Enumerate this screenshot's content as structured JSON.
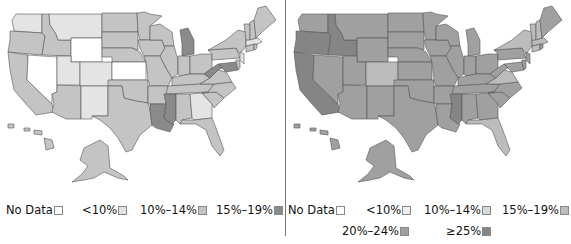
{
  "maps": [
    {
      "id": "left",
      "legend": [
        {
          "label": "No Data",
          "color": "#ffffff"
        },
        {
          "label": "<10%",
          "color": "#e4e4e4"
        },
        {
          "label": "10%–14%",
          "color": "#c4c4c4"
        },
        {
          "label": "15%–19%",
          "color": "#8a8a8a"
        }
      ]
    },
    {
      "id": "right",
      "legend": [
        {
          "label": "No Data",
          "color": "#ffffff"
        },
        {
          "label": "<10%",
          "color": "#eeeeee"
        },
        {
          "label": "10%–14%",
          "color": "#d8d8d8"
        },
        {
          "label": "15%–19%",
          "color": "#bcbcbc"
        },
        {
          "label": "20%–24%",
          "color": "#a0a0a0"
        },
        {
          "label": "≥25%",
          "color": "#858585"
        }
      ]
    }
  ],
  "chart_data": [
    {
      "type": "choropleth",
      "region": "United States",
      "legend": [
        "No Data",
        "<10%",
        "10%–14%",
        "15%–19%"
      ],
      "states": {
        "No Data": [
          "NV",
          "WY",
          "KS"
        ],
        "<10%": [
          "WA",
          "MT",
          "UT",
          "CO",
          "NM",
          "GA",
          "MA",
          "NJ"
        ],
        "10%–14%": [
          "OR",
          "ID",
          "CA",
          "AZ",
          "ND",
          "SD",
          "NE",
          "OK",
          "TX",
          "MN",
          "IA",
          "MO",
          "AR",
          "WI",
          "IL",
          "IN",
          "OH",
          "KY",
          "TN",
          "AL",
          "FL",
          "SC",
          "NC",
          "VA",
          "PA",
          "NY",
          "VT",
          "NH",
          "ME",
          "CT",
          "RI",
          "DE",
          "AK",
          "HI"
        ],
        "15%–19%": [
          "MI",
          "WV",
          "MS",
          "LA",
          "MD"
        ]
      }
    },
    {
      "type": "choropleth",
      "region": "United States",
      "legend": [
        "No Data",
        "<10%",
        "10%–14%",
        "15%–19%",
        "20%–24%",
        "≥25%"
      ],
      "states": {
        "15%–19%": [
          "CO",
          "NY",
          "VA",
          "FL",
          "VT",
          "NH",
          "MA",
          "CT"
        ],
        "20%–24%": [
          "WA",
          "MT",
          "WY",
          "NV",
          "UT",
          "AZ",
          "NM",
          "ND",
          "MN",
          "ME",
          "HI",
          "AK",
          "WI",
          "MI",
          "IL",
          "IN",
          "OH",
          "PA",
          "NJ",
          "KY",
          "TN",
          "NC",
          "SC",
          "GA",
          "AL",
          "AR",
          "MO",
          "IA",
          "NE",
          "KS",
          "OK",
          "TX",
          "LA",
          "WV",
          "MD",
          "DE",
          "RI",
          "SD"
        ],
        "≥25%": [
          "OR",
          "ID",
          "CA",
          "MS"
        ]
      }
    }
  ]
}
